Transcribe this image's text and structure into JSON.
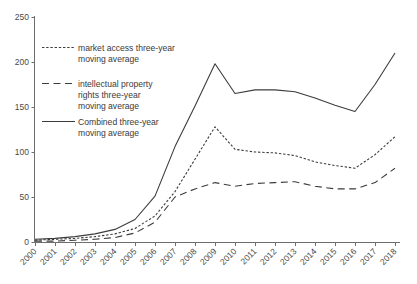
{
  "chart_data": {
    "type": "line",
    "title": "",
    "xlabel": "",
    "ylabel": "",
    "ylim": [
      0,
      250
    ],
    "yticks": [
      0,
      50,
      100,
      150,
      200,
      250
    ],
    "grid": false,
    "legend_position": "upper-left",
    "categories": [
      "2000",
      "2001",
      "2002",
      "2003",
      "2004",
      "2005",
      "2006",
      "2007",
      "2008",
      "2009",
      "2010",
      "2011",
      "2012",
      "2013",
      "2014",
      "2015",
      "2016",
      "2017",
      "2018"
    ],
    "series": [
      {
        "name": "market access three-year moving average",
        "style": "dotted",
        "values": [
          2,
          3,
          4,
          6,
          9,
          15,
          29,
          56,
          92,
          128,
          103,
          100,
          99,
          96,
          89,
          85,
          82,
          97,
          117
        ]
      },
      {
        "name": "intellectual property rights three-year moving average",
        "style": "dashed",
        "values": [
          1,
          1,
          2,
          3,
          5,
          10,
          22,
          50,
          59,
          66,
          62,
          65,
          66,
          67,
          62,
          59,
          59,
          66,
          82
        ]
      },
      {
        "name": "Combined three-year moving average",
        "style": "solid",
        "values": [
          3,
          4,
          6,
          9,
          14,
          25,
          51,
          106,
          151,
          198,
          165,
          169,
          169,
          167,
          160,
          152,
          145,
          175,
          210
        ]
      }
    ]
  },
  "legend": {
    "items": [
      {
        "label_line1": "market access three-year",
        "label_line2": "moving average",
        "label_line3": "",
        "style": "dotted"
      },
      {
        "label_line1": "intellectual property",
        "label_line2": "rights three-year",
        "label_line3": "moving average",
        "style": "dashed"
      },
      {
        "label_line1": "Combined three-year",
        "label_line2": "moving average",
        "label_line3": "",
        "style": "solid"
      }
    ]
  },
  "axes": {
    "y_tick_labels": [
      "250",
      "200",
      "150",
      "100",
      "50",
      "0"
    ],
    "x_tick_labels": [
      "2000",
      "2001",
      "2002",
      "2003",
      "2004",
      "2005",
      "2006",
      "2007",
      "2008",
      "2009",
      "2010",
      "2011",
      "2012",
      "2013",
      "2014",
      "2015",
      "2016",
      "2017",
      "2018"
    ]
  }
}
